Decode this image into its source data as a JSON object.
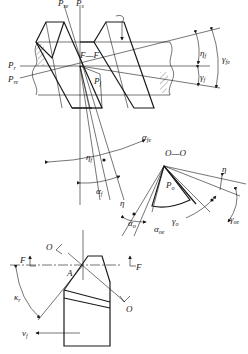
{
  "diagram": {
    "top_view": {
      "plane_labels": {
        "p_se": "P",
        "p_se_sub": "se",
        "p_s": "P",
        "p_s_sub": "s",
        "p_r": "P",
        "p_r_sub": "r",
        "p_re": "P",
        "p_re_sub": "re",
        "section_ff": "F—F",
        "p_f": "P",
        "p_f_sub": "f"
      },
      "angle_labels": {
        "eta_f": "η",
        "eta_f_sub": "f",
        "gamma_fe": "γ",
        "gamma_fe_sub": "fe",
        "gamma_f": "γ",
        "gamma_f_sub": "f"
      }
    },
    "middle_view": {
      "angle_labels": {
        "alpha_fe": "α",
        "alpha_fe_sub": "fe",
        "eta_f": "η",
        "eta_f_sub": "f",
        "alpha_f": "α",
        "alpha_f_sub": "f"
      }
    },
    "section_oo": {
      "title": "O—O",
      "labels": {
        "p_o": "P",
        "p_o_sub": "o",
        "eta_left": "η",
        "eta_right": "η",
        "alpha_o": "α",
        "alpha_o_sub": "o",
        "alpha_oe": "α",
        "alpha_oe_sub": "oe",
        "gamma_o": "γ",
        "gamma_o_sub": "o",
        "gamma_oe": "γ",
        "gamma_oe_sub": "oe"
      }
    },
    "bottom_view": {
      "labels": {
        "o_top": "O",
        "o_bottom": "O",
        "f_left": "F",
        "f_right": "F",
        "point_a": "A",
        "kappa_r": "κ",
        "kappa_r_sub": "r",
        "v_f": "v",
        "v_f_sub": "f"
      }
    }
  }
}
